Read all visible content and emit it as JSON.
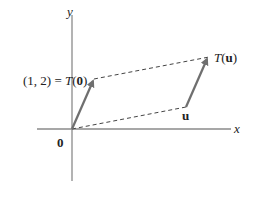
{
  "diagram": {
    "axes": {
      "x_label": "x",
      "y_label": "y",
      "origin_label": "0"
    },
    "labels": {
      "t0_prefix": "(1, 2) = ",
      "t0_T": "T",
      "t0_open": "(",
      "t0_arg": "0",
      "t0_close": ")",
      "u": "u",
      "tu_T": "T",
      "tu_open": "(",
      "tu_arg": "u",
      "tu_close": ")"
    },
    "colors": {
      "axis": "#8a8a8a",
      "arrow": "#6f6f6f",
      "dashed": "#444444",
      "text": "#222222"
    }
  }
}
